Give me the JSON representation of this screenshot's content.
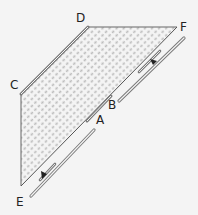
{
  "diagram": {
    "type": "geometry-flow",
    "background": "#f4f4f4",
    "shape_fill": "#c8c8c8",
    "line_color": "#555555",
    "double_line_color": "#8a8a8a",
    "labels": {
      "A": "A",
      "B": "B",
      "C": "C",
      "D": "D",
      "E": "E",
      "F": "F"
    },
    "vertices": {
      "C": [
        21,
        94
      ],
      "D": [
        88,
        27
      ],
      "F": [
        177,
        27
      ],
      "E": [
        21,
        186
      ]
    },
    "arrows": [
      {
        "name": "arrow-up-right",
        "direction": "toward F",
        "at": [
          153,
          60
        ]
      },
      {
        "name": "arrow-down-left",
        "direction": "toward E",
        "at": [
          43,
          176
        ]
      }
    ]
  }
}
